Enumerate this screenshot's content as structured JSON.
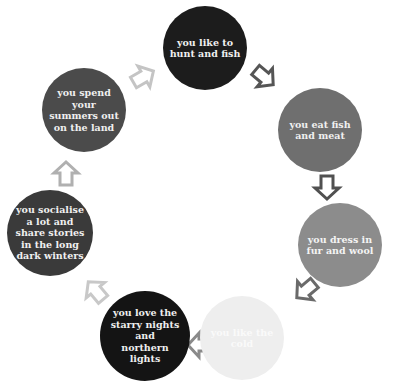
{
  "diagram": {
    "type": "cycle",
    "nodes": [
      {
        "id": "hunt",
        "label": "you like to hunt and fish",
        "lines": [
          "you like to",
          "hunt and fish"
        ],
        "color": "#1c1c1c",
        "text_color": "#f0f0f0",
        "cx": 205,
        "cy": 48,
        "r": 42
      },
      {
        "id": "eat",
        "label": "you eat fish and meat",
        "lines": [
          "you eat fish",
          "and meat"
        ],
        "color": "#6f6f6f",
        "text_color": "#f0f0f0",
        "cx": 320,
        "cy": 130,
        "r": 42
      },
      {
        "id": "dress",
        "label": "you dress in fur and wool",
        "lines": [
          "you dress in",
          "fur and wool"
        ],
        "color": "#8c8c8c",
        "text_color": "#f4f4f4",
        "cx": 340,
        "cy": 245,
        "r": 42
      },
      {
        "id": "cold",
        "label": "you like the cold",
        "lines": [
          "you like the",
          "cold"
        ],
        "color": "#eeeeee",
        "text_color": "#fafafa",
        "cx": 242,
        "cy": 338,
        "r": 42
      },
      {
        "id": "stars",
        "label": "you love the starry nights and northern lights",
        "lines": [
          "you love the",
          "starry nights",
          "and",
          "northern",
          "lights"
        ],
        "color": "#141414",
        "text_color": "#eeeeee",
        "cx": 145,
        "cy": 336,
        "r": 45
      },
      {
        "id": "socialise",
        "label": "you socialise a lot and share stories in the long dark winters",
        "lines": [
          "you socialise",
          "a lot and",
          "share stories",
          "in the long",
          "dark winters"
        ],
        "color": "#3a3a3a",
        "text_color": "#f0f0f0",
        "cx": 50,
        "cy": 233,
        "r": 43
      },
      {
        "id": "summers",
        "label": "you spend your summers out on the land",
        "lines": [
          "you spend",
          "your",
          "summers out",
          "on the land"
        ],
        "color": "#4b4b4b",
        "text_color": "#f0f0f0",
        "cx": 84,
        "cy": 110,
        "r": 42
      }
    ],
    "arrows": [
      {
        "from": "summers",
        "to": "hunt",
        "x": 143,
        "y": 77,
        "angle": -30,
        "color": "#c4c4c4"
      },
      {
        "from": "hunt",
        "to": "eat",
        "x": 264,
        "y": 77,
        "angle": 40,
        "color": "#555555"
      },
      {
        "from": "eat",
        "to": "dress",
        "x": 327,
        "y": 187,
        "angle": 90,
        "color": "#505050"
      },
      {
        "from": "dress",
        "to": "cold",
        "x": 306,
        "y": 290,
        "angle": 140,
        "color": "#6a6a6a"
      },
      {
        "from": "cold",
        "to": "stars",
        "x": 200,
        "y": 345,
        "angle": 180,
        "color": "#8a8a8a"
      },
      {
        "from": "stars",
        "to": "socialise",
        "x": 96,
        "y": 291,
        "angle": -130,
        "color": "#c8c8c8"
      },
      {
        "from": "socialise",
        "to": "summers",
        "x": 66,
        "y": 174,
        "angle": -90,
        "color": "#b0b0b0"
      }
    ]
  }
}
